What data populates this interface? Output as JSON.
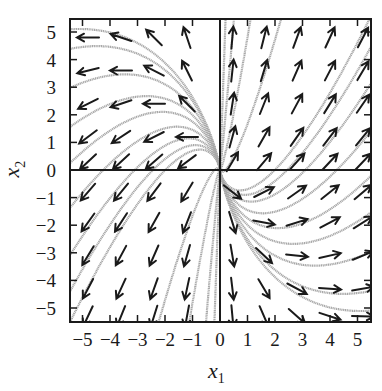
{
  "chart_data": {
    "type": "phase_portrait",
    "title": "",
    "xlabel": "x1",
    "ylabel": "x2",
    "xlim": [
      -5.45,
      5.5
    ],
    "ylim": [
      -5.5,
      5.5
    ],
    "xticks": [
      -5,
      -4,
      -3,
      -2,
      -1,
      0,
      1,
      2,
      3,
      4,
      5
    ],
    "yticks": [
      -5,
      -4,
      -3,
      -2,
      -1,
      0,
      1,
      2,
      3,
      4,
      5
    ],
    "xtick_labels": [
      "−5",
      "−4",
      "−3",
      "−2",
      "−1",
      "0",
      "1",
      "2",
      "3",
      "4",
      "5"
    ],
    "ytick_labels": [
      "−5",
      "−4",
      "−3",
      "−2",
      "−1",
      "0",
      "1",
      "2",
      "3",
      "4",
      "5"
    ],
    "axes_through_origin": true,
    "grid": false,
    "legend": null,
    "system": {
      "description": "linear system, unstable node",
      "dx1": "x1",
      "dx2": "x1 + x2",
      "matrix": [
        [
          1,
          0
        ],
        [
          1,
          1
        ]
      ]
    },
    "quiver": {
      "x": [
        -4.8,
        -3.6,
        -2.4,
        -1.2,
        0.45,
        1.6,
        2.8,
        4.0,
        5.2
      ],
      "y": [
        4.8,
        3.6,
        2.4,
        1.2,
        0.3,
        -0.8,
        -1.9,
        -3.1,
        -4.3,
        -5.3
      ],
      "color": "#1a1a1a"
    },
    "streamlines": {
      "color": "#a8a8a8",
      "seeds": [
        [
          -5.4,
          5.1
        ],
        [
          -5.4,
          4.4
        ],
        [
          -5.4,
          3.0
        ],
        [
          -5.4,
          1.6
        ],
        [
          -5.4,
          0.3
        ],
        [
          -5.4,
          -1.3
        ],
        [
          -5.4,
          -3.0
        ],
        [
          -5.4,
          -4.3
        ],
        [
          -5.4,
          -5.4
        ],
        [
          5.4,
          -5.1
        ],
        [
          5.4,
          -4.4
        ],
        [
          5.4,
          -3.0
        ],
        [
          5.4,
          -1.6
        ],
        [
          5.4,
          -0.3
        ],
        [
          5.4,
          1.3
        ],
        [
          5.4,
          3.0
        ],
        [
          5.4,
          4.3
        ],
        [
          5.4,
          5.4
        ],
        [
          0.2,
          5.4
        ],
        [
          0.5,
          5.4
        ],
        [
          1.1,
          5.4
        ],
        [
          2.2,
          5.4
        ],
        [
          -0.2,
          -5.4
        ],
        [
          -0.5,
          -5.4
        ],
        [
          -1.1,
          -5.4
        ],
        [
          -2.2,
          -5.4
        ]
      ]
    }
  },
  "axes": {
    "xlabel_main": "x",
    "xlabel_sub": "1",
    "ylabel_main": "x",
    "ylabel_sub": "2"
  },
  "colors": {
    "frame": "#1a1a1a",
    "arrow": "#1a1a1a",
    "streamline": "#a8a8a8",
    "background": "#ffffff"
  }
}
